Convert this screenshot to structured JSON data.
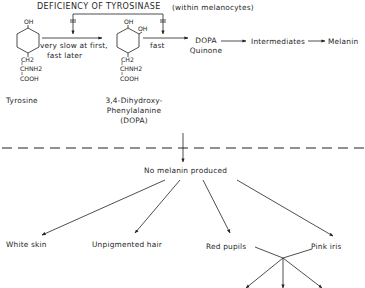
{
  "title": {
    "main": "DEFICIENCY OF TYROSINASE",
    "note": "(within melanocytes)"
  },
  "pathway": {
    "tyrosine": {
      "name": "Tyrosine",
      "oh_top": "OH",
      "ch2": "CH2",
      "chnh2": "CHNH2",
      "cooh": "COOH"
    },
    "step1_label_line1": "very slow at first,",
    "step1_label_line2": "fast later",
    "dopa": {
      "name_line1": "3,4-Dihydroxy-",
      "name_line2": "Phenylalanine",
      "name_line3": "(DOPA)",
      "oh_top": "OH",
      "oh_side": "OH",
      "ch2": "CH2",
      "chnh2": "CHNH2",
      "cooh": "COOH"
    },
    "step2_label": "fast",
    "dopa_quinone_line1": "DOPA",
    "dopa_quinone_line2": "Quinone",
    "intermediates": "Intermediates",
    "melanin": "Melanin"
  },
  "outcome": {
    "root": "No melanin produced",
    "effects": [
      "White skin",
      "Unpigmented hair",
      "Red pupils",
      "Pink iris"
    ]
  }
}
